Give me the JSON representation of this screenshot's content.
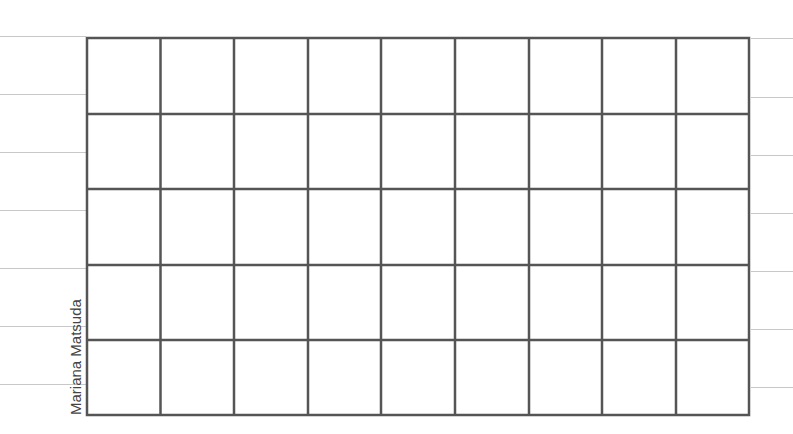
{
  "sheet": {
    "author_label": "Mariana Matsuda",
    "grid": {
      "columns": 9,
      "rows": 5,
      "line_color": "#555555"
    },
    "rule_color": "#c8c8c8",
    "left_rules_y": [
      36,
      94,
      152,
      210,
      268,
      326,
      384
    ],
    "right_rules_y": [
      38,
      97,
      155,
      213,
      271,
      329,
      387
    ]
  }
}
